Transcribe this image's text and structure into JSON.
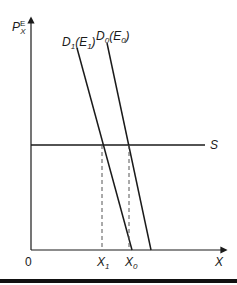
{
  "diagram": {
    "type": "supply-demand",
    "y_axis": {
      "label": "P",
      "label_sub": "X",
      "label_sup": "E"
    },
    "x_axis": {
      "label": "X",
      "origin": "0"
    },
    "supply": {
      "label": "S"
    },
    "demand_curves": [
      {
        "label": "D",
        "sub": "1",
        "paren": "E",
        "paren_sub": "1"
      },
      {
        "label": "D",
        "sub": "0",
        "paren": "E",
        "paren_sub": "0"
      }
    ],
    "x_ticks": [
      {
        "label": "X",
        "sub": "1"
      },
      {
        "label": "X",
        "sub": "0"
      }
    ],
    "colors": {
      "line": "#1a1a1a",
      "dash": "#555555"
    }
  }
}
